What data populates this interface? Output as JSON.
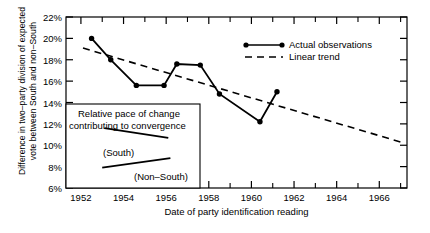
{
  "chart_data": {
    "type": "line",
    "title": "",
    "xlabel": "Date of party identification reading",
    "ylabel": "Difference in two–party division of expected\nvote between South and non–South",
    "xlim": [
      1951.3,
      1967.3
    ],
    "ylim": [
      6,
      22
    ],
    "xticks": [
      1952,
      1954,
      1956,
      1958,
      1960,
      1962,
      1964,
      1966
    ],
    "xtick_labels": [
      "1952",
      "1954",
      "1956",
      "1958",
      "1960",
      "1962",
      "1964",
      "1966"
    ],
    "yticks": [
      6,
      8,
      10,
      12,
      14,
      16,
      18,
      20,
      22
    ],
    "ytick_labels": [
      "6%",
      "8%",
      "10%",
      "12%",
      "14%",
      "16%",
      "18%",
      "20%",
      "22%"
    ],
    "grid": false,
    "legend_position": "upper right",
    "series": [
      {
        "name": "Actual observations",
        "style": "solid-with-markers",
        "color": "#000000",
        "points": [
          {
            "x": 1952.5,
            "y": 20.0
          },
          {
            "x": 1953.4,
            "y": 18.0
          },
          {
            "x": 1954.6,
            "y": 15.6
          },
          {
            "x": 1955.9,
            "y": 15.6
          },
          {
            "x": 1956.5,
            "y": 17.6
          },
          {
            "x": 1957.6,
            "y": 17.5
          },
          {
            "x": 1958.5,
            "y": 14.8
          },
          {
            "x": 1960.4,
            "y": 12.2
          },
          {
            "x": 1961.2,
            "y": 15.0
          }
        ]
      },
      {
        "name": "Linear trend",
        "style": "dashed",
        "color": "#000000",
        "points": [
          {
            "x": 1952.1,
            "y": 19.1
          },
          {
            "x": 1967.0,
            "y": 10.3
          }
        ]
      }
    ],
    "annotations": {
      "inset_title_line1": "Relative pace of change",
      "inset_title_line2": "contributing to convergence",
      "south_label": "(South)",
      "nonsouth_label": "(Non–South)",
      "south_segment": [
        {
          "x": 1953.1,
          "y": 11.6
        },
        {
          "x": 1956.1,
          "y": 10.7
        }
      ],
      "nonsouth_segment": [
        {
          "x": 1953.0,
          "y": 7.9
        },
        {
          "x": 1956.2,
          "y": 8.8
        }
      ]
    }
  },
  "legend": {
    "items": [
      {
        "label": "Actual observations",
        "style": "solid-with-markers"
      },
      {
        "label": "Linear trend",
        "style": "dashed"
      }
    ]
  }
}
